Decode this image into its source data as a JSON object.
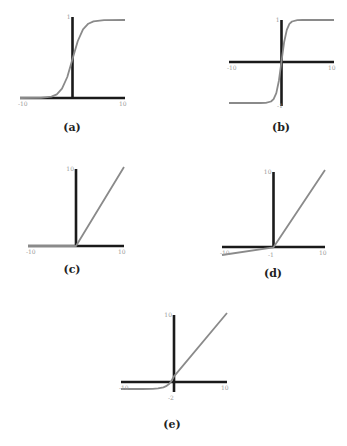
{
  "chart_data": [
    {
      "id": "a",
      "type": "line",
      "caption": "(a)",
      "function": "sigmoid",
      "xlim": [
        -10,
        10
      ],
      "ylim": [
        0,
        1
      ],
      "tick_labels": {
        "x_min": "-10",
        "x_max": "10",
        "y_max": "1",
        "y_min": ""
      },
      "series": [
        {
          "name": "sigmoid",
          "x": [
            -10,
            -6,
            -4,
            -3,
            -2,
            -1,
            0,
            1,
            2,
            3,
            4,
            6,
            10
          ],
          "y": [
            0.0,
            0.002,
            0.018,
            0.047,
            0.119,
            0.269,
            0.5,
            0.731,
            0.881,
            0.953,
            0.982,
            0.998,
            1.0
          ]
        }
      ],
      "grid": false
    },
    {
      "id": "b",
      "type": "line",
      "caption": "(b)",
      "function": "tanh",
      "xlim": [
        -10,
        10
      ],
      "ylim": [
        -1,
        1
      ],
      "tick_labels": {
        "x_min": "-10",
        "x_max": "10",
        "y_max": "1",
        "y_min": "-1"
      },
      "series": [
        {
          "name": "tanh",
          "x": [
            -10,
            -4,
            -3,
            -2,
            -1.5,
            -1,
            -0.5,
            0,
            0.5,
            1,
            1.5,
            2,
            3,
            4,
            10
          ],
          "y": [
            -1.0,
            -0.999,
            -0.995,
            -0.964,
            -0.905,
            -0.762,
            -0.462,
            0,
            0.462,
            0.762,
            0.905,
            0.964,
            0.995,
            0.999,
            1.0
          ]
        }
      ],
      "grid": false
    },
    {
      "id": "c",
      "type": "line",
      "caption": "(c)",
      "function": "relu",
      "xlim": [
        -10,
        10
      ],
      "ylim": [
        0,
        10
      ],
      "tick_labels": {
        "x_min": "-10",
        "x_max": "10",
        "y_max": "10",
        "y_min": ""
      },
      "series": [
        {
          "name": "relu",
          "x": [
            -10,
            0,
            10
          ],
          "y": [
            0,
            0,
            10
          ]
        }
      ],
      "grid": false
    },
    {
      "id": "d",
      "type": "line",
      "caption": "(d)",
      "function": "leaky_relu",
      "xlim": [
        -10,
        10
      ],
      "ylim": [
        -1,
        10
      ],
      "tick_labels": {
        "x_min": "-10",
        "x_max": "10",
        "y_max": "10",
        "y_min": "-1"
      },
      "series": [
        {
          "name": "leaky relu",
          "x": [
            -10,
            0,
            10
          ],
          "y": [
            -1,
            0,
            10
          ]
        }
      ],
      "grid": false
    },
    {
      "id": "e",
      "type": "line",
      "caption": "(e)",
      "function": "elu",
      "xlim": [
        -10,
        10
      ],
      "ylim": [
        -2,
        10
      ],
      "tick_labels": {
        "x_min": "-10",
        "x_max": "10",
        "y_max": "10",
        "y_min": "-2"
      },
      "series": [
        {
          "name": "elu",
          "x": [
            -10,
            -6,
            -4,
            -3,
            -2,
            -1.5,
            -1,
            -0.5,
            0,
            10
          ],
          "y": [
            -2.0,
            -1.995,
            -1.963,
            -1.9,
            -1.729,
            -1.554,
            -1.264,
            -0.787,
            0,
            10
          ]
        }
      ],
      "grid": false
    }
  ],
  "colors": {
    "axis": "#1a1a1a",
    "curve": "#8a8a8a",
    "tick": "#9a9a9a",
    "caption": "#222222"
  }
}
